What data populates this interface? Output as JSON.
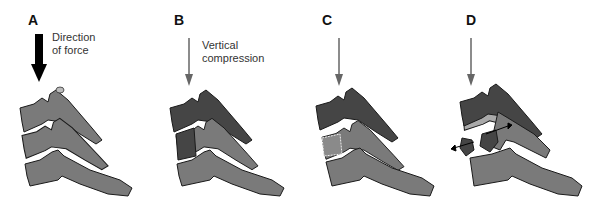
{
  "figure": {
    "panels": [
      {
        "letter": "A",
        "caption_line1": "Direction",
        "caption_line2": "of force"
      },
      {
        "letter": "B",
        "caption_line1": "Vertical",
        "caption_line2": "compression"
      },
      {
        "letter": "C",
        "caption_line1": "",
        "caption_line2": ""
      },
      {
        "letter": "D",
        "caption_line1": "",
        "caption_line2": ""
      }
    ],
    "colors": {
      "bone_light": "#7a7a7a",
      "bone_dark": "#454545",
      "bone_pale": "#a9a9a9",
      "outline": "#1a1a1a",
      "arrow_gray": "#666666",
      "arrow_black": "#000000"
    }
  }
}
